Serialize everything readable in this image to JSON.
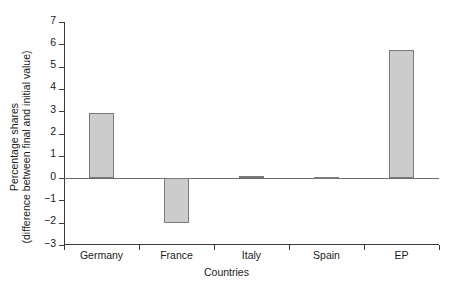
{
  "chart_data": {
    "type": "bar",
    "title": "",
    "xlabel": "Countries",
    "ylabel": "Percentage shares (difference between final and initial value)",
    "ylabel_lines": [
      "Percentage shares",
      "(difference between final and initial value)"
    ],
    "categories": [
      "Germany",
      "France",
      "Italy",
      "Spain",
      "EP"
    ],
    "values": [
      2.9,
      -2.0,
      0.08,
      0.07,
      5.75
    ],
    "ylim": [
      -3,
      7
    ],
    "yticks": [
      -3,
      -2,
      -1,
      0,
      1,
      2,
      3,
      4,
      5,
      6,
      7
    ],
    "ytick_labels": [
      "−3",
      "−2",
      "−1",
      "0",
      "1",
      "2",
      "3",
      "4",
      "5",
      "6",
      "7"
    ],
    "grid": false,
    "legend": false,
    "bar_color": "#cccccc",
    "bar_edge_color": "#7a7a7a",
    "axis_color": "#3a3a3a",
    "zero_line_color": "#6e6e6e"
  }
}
